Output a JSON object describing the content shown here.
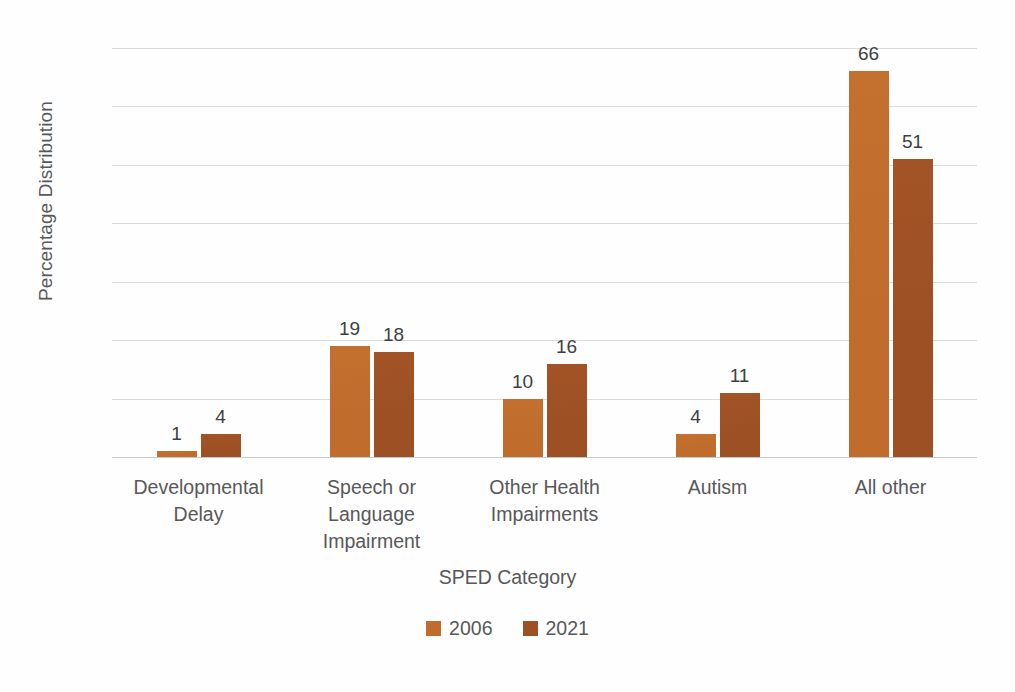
{
  "chart_data": {
    "type": "bar",
    "title": "",
    "xlabel": "SPED Category",
    "ylabel": "Percentage Distribution",
    "categories": [
      "Developmental Delay",
      "Speech or Language Impairment",
      "Other Health Impairments",
      "Autism",
      "All other"
    ],
    "category_lines": [
      [
        "Developmental",
        "Delay"
      ],
      [
        "Speech or",
        "Language",
        "Impairment"
      ],
      [
        "Other Health",
        "Impairments"
      ],
      [
        "Autism"
      ],
      [
        "All other"
      ]
    ],
    "series": [
      {
        "name": "2006",
        "color": "#C06C2C",
        "values": [
          1,
          19,
          10,
          4,
          66
        ]
      },
      {
        "name": "2021",
        "color": "#9C5024",
        "values": [
          4,
          18,
          16,
          11,
          51
        ]
      }
    ],
    "ylim": [
      0,
      70
    ],
    "yticks": [
      0,
      10,
      20,
      30,
      40,
      50,
      60,
      70
    ],
    "ytick_labels": [
      "0",
      "10",
      "20",
      "30",
      "40",
      "50",
      "60",
      "70"
    ],
    "grid": true,
    "legend_position": "bottom",
    "legend_entries": [
      "2006",
      "2021"
    ],
    "data_labels": {
      "2006": [
        "1",
        "19",
        "10",
        "4",
        "66"
      ],
      "2021": [
        "4",
        "18",
        "16",
        "11",
        "51"
      ]
    }
  },
  "colors": {
    "series_2006": "#C06C2C",
    "series_2021": "#9C5024",
    "gridline": "#D9DADB",
    "text": "#58585A",
    "background": "#FFFFFF"
  }
}
